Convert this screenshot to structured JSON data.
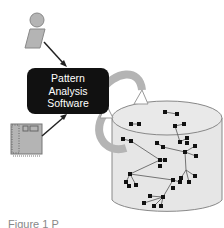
{
  "diagram": {
    "box": {
      "lines": [
        "Pattern",
        "Analysis",
        "Software"
      ]
    },
    "caption": "Figure 1 P",
    "nodes": [
      "person-icon",
      "circuit-board-icon",
      "pattern-analysis-box",
      "cycle-arrow",
      "database-cylinder"
    ],
    "colors": {
      "box": "#111111",
      "shape_fill": "#b4b4b4",
      "cylinder_fill": "#e6e6e6",
      "edge": "#333333"
    }
  }
}
